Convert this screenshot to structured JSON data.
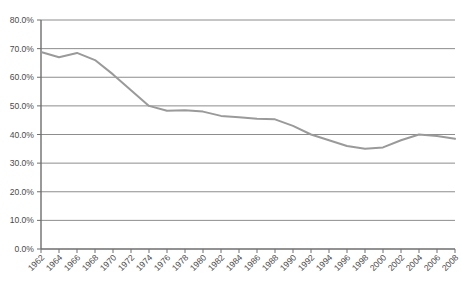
{
  "chart_data": {
    "type": "line",
    "title": "",
    "xlabel": "",
    "ylabel": "",
    "grid": true,
    "legend": false,
    "ylim": [
      0,
      80
    ],
    "ytick_labels": [
      "0.0%",
      "10.0%",
      "20.0%",
      "30.0%",
      "40.0%",
      "50.0%",
      "60.0%",
      "70.0%",
      "80.0%"
    ],
    "ytick_values": [
      0,
      10,
      20,
      30,
      40,
      50,
      60,
      70,
      80
    ],
    "categories": [
      "1962",
      "1964",
      "1966",
      "1968",
      "1970",
      "1972",
      "1974",
      "1976",
      "1978",
      "1980",
      "1982",
      "1984",
      "1986",
      "1988",
      "1990",
      "1992",
      "1994",
      "1996",
      "1998",
      "2000",
      "2002",
      "2004",
      "2006",
      "2008"
    ],
    "values": [
      68.8,
      67.0,
      68.5,
      66.0,
      61.0,
      55.5,
      50.0,
      48.3,
      48.5,
      48.0,
      46.5,
      46.0,
      45.5,
      45.3,
      43.0,
      40.0,
      38.0,
      36.0,
      35.0,
      35.5,
      38.0,
      40.0,
      39.5,
      38.5
    ],
    "series": [
      {
        "name": "series-1",
        "color": "#9a9a9a",
        "values": [
          68.8,
          67.0,
          68.5,
          66.0,
          61.0,
          55.5,
          50.0,
          48.3,
          48.5,
          48.0,
          46.5,
          46.0,
          45.5,
          45.3,
          43.0,
          40.0,
          38.0,
          36.0,
          35.0,
          35.5,
          38.0,
          40.0,
          39.5,
          38.5
        ]
      }
    ]
  },
  "colors": {
    "line": "#9a9a9a",
    "grid": "#808080",
    "axis": "#6e6e6e",
    "text": "#4a4a4a",
    "background": "#ffffff"
  }
}
